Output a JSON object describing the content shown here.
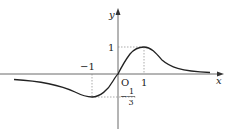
{
  "figure": {
    "type": "function-graph",
    "axes": {
      "x_label": "x",
      "y_label": "y",
      "origin_label": "O"
    },
    "tick_labels": {
      "x_pos": "1",
      "x_neg": "−1",
      "y_pos": "1",
      "y_neg_sign": "−",
      "y_neg_num": "1",
      "y_neg_den": "3"
    },
    "key_points": [
      {
        "name": "maximum",
        "x": 1,
        "y": 1
      },
      {
        "name": "minimum",
        "x": -1,
        "y": "-1/3"
      },
      {
        "name": "origin",
        "x": 0,
        "y": 0
      }
    ],
    "asymptote": "y = 0 (curve approaches x-axis as x → ±∞)",
    "colors": {
      "curve": "#222222",
      "axes": "#333333",
      "guides": "#888888"
    }
  }
}
